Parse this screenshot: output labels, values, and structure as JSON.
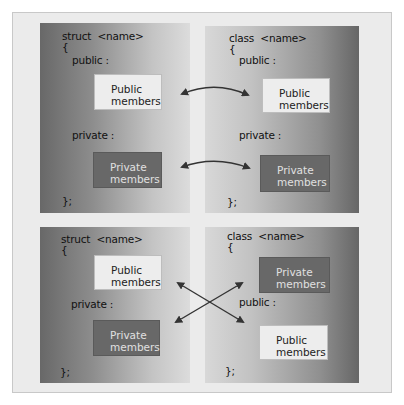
{
  "diagram": {
    "top_left": {
      "header": "struct  <name>",
      "open_brace": "{",
      "public_label": "public :",
      "public_box": [
        "Public",
        "members"
      ],
      "private_label": "private :",
      "private_box": [
        "Private",
        "members"
      ],
      "close": "};"
    },
    "top_right": {
      "header": "class  <name>",
      "open_brace": "{",
      "public_label": "public :",
      "public_box": [
        "Public",
        "members"
      ],
      "private_label": "private :",
      "private_box": [
        "Private",
        "members"
      ],
      "close": "};"
    },
    "bottom_left": {
      "header": "struct  <name>",
      "open_brace": "{",
      "public_box": [
        "Public",
        "members"
      ],
      "private_label": "private :",
      "private_box": [
        "Private",
        "members"
      ],
      "close": "};"
    },
    "bottom_right": {
      "header": "class  <name>",
      "open_brace": "{",
      "private_box": [
        "Private",
        "members"
      ],
      "public_label": "public :",
      "public_box": [
        "Public",
        "members"
      ],
      "close": "};"
    },
    "arrows": [
      {
        "from": "top_left.public_box",
        "to": "top_right.public_box",
        "type": "double-headed curved"
      },
      {
        "from": "top_left.private_box",
        "to": "top_right.private_box",
        "type": "double-headed curved"
      },
      {
        "from": "bottom_left.public_box",
        "to": "bottom_right.public_label",
        "type": "double-headed crossing"
      },
      {
        "from": "bottom_left.private_box",
        "to": "bottom_right.private_box",
        "type": "double-headed crossing"
      }
    ],
    "colors": {
      "frame": "#ebebeb",
      "public_box": "#ededed",
      "private_box": "#686868",
      "arrow": "#333333"
    }
  }
}
